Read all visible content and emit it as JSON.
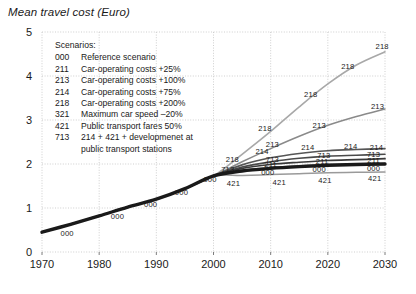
{
  "chart_data": {
    "type": "line",
    "title": "Mean travel cost (Euro)",
    "xlabel": "",
    "ylabel": "Mean travel cost (Euro)",
    "xlim": [
      1970,
      2030
    ],
    "ylim": [
      0,
      5
    ],
    "grid": true,
    "legend_position": "inside-top-left",
    "yticks": [
      "0",
      "1",
      "2",
      "3",
      "4",
      "5"
    ],
    "ytick_values": [
      0,
      1,
      2,
      3,
      4,
      5
    ],
    "xticks": [
      "1970",
      "1980",
      "1990",
      "2000",
      "2010",
      "2020",
      "2030"
    ],
    "xtick_values": [
      1970,
      1980,
      1990,
      2000,
      2010,
      2020,
      2030
    ],
    "x": [
      1970,
      1975,
      1980,
      1985,
      1990,
      1995,
      2000,
      2005,
      2010,
      2015,
      2020,
      2025,
      2030
    ],
    "series": [
      {
        "name": "000",
        "label": "Reference scenario",
        "color": "#1a1a1a",
        "width": 3.4,
        "values": [
          0.45,
          0.63,
          0.82,
          1.02,
          1.2,
          1.44,
          1.73,
          1.84,
          1.9,
          1.94,
          1.97,
          1.99,
          2.0
        ]
      },
      {
        "name": "211",
        "label": "Car-operating costs +25%",
        "color": "#3a3a3a",
        "width": 1.7,
        "values": [
          0.45,
          0.63,
          0.82,
          1.02,
          1.2,
          1.44,
          1.73,
          1.9,
          1.99,
          2.04,
          2.08,
          2.1,
          2.12
        ]
      },
      {
        "name": "213",
        "label": "Car-operating costs +100%",
        "color": "#8a8a8a",
        "width": 1.5,
        "values": [
          0.45,
          0.63,
          0.82,
          1.02,
          1.2,
          1.44,
          1.73,
          2.05,
          2.35,
          2.63,
          2.88,
          3.08,
          3.25
        ]
      },
      {
        "name": "214",
        "label": "Car-operating costs +75%",
        "color": "#565656",
        "width": 1.6,
        "values": [
          0.45,
          0.63,
          0.82,
          1.02,
          1.2,
          1.44,
          1.73,
          1.98,
          2.14,
          2.24,
          2.3,
          2.33,
          2.35
        ]
      },
      {
        "name": "218",
        "label": "Car-operating costs +200%",
        "color": "#a8a8a8",
        "width": 1.6,
        "values": [
          0.45,
          0.63,
          0.82,
          1.02,
          1.2,
          1.44,
          1.73,
          2.22,
          2.74,
          3.3,
          3.82,
          4.25,
          4.55
        ]
      },
      {
        "name": "321",
        "label": "Maximum car speed –20%",
        "color": "#6e6e6e",
        "width": 1.4,
        "values": [
          0.45,
          0.63,
          0.82,
          1.02,
          1.2,
          1.44,
          1.73,
          1.86,
          1.92,
          1.96,
          1.99,
          2.0,
          2.01
        ]
      },
      {
        "name": "421",
        "label": "Public transport fares 50%",
        "color": "#9a9a9a",
        "width": 1.5,
        "values": [
          0.45,
          0.63,
          0.82,
          1.02,
          1.2,
          1.44,
          1.73,
          1.74,
          1.76,
          1.78,
          1.8,
          1.81,
          1.82
        ]
      },
      {
        "name": "713",
        "label": "214 + 421 + developmenet at public transport stations",
        "color": "#4a4a4a",
        "width": 1.6,
        "values": [
          0.45,
          0.63,
          0.82,
          1.02,
          1.2,
          1.44,
          1.73,
          1.93,
          2.05,
          2.13,
          2.18,
          2.2,
          2.22
        ]
      }
    ],
    "curve_tags": [
      {
        "series": "000",
        "x": 1974.4,
        "y": 0.43
      },
      {
        "series": "000",
        "x": 1983.2,
        "y": 0.82
      },
      {
        "series": "000",
        "x": 1989.0,
        "y": 1.09
      },
      {
        "series": "000",
        "x": 1994.4,
        "y": 1.36
      },
      {
        "series": "000",
        "x": 1999.4,
        "y": 1.66
      },
      {
        "series": "000",
        "x": 2009.5,
        "y": 1.81
      },
      {
        "series": "000",
        "x": 2018.5,
        "y": 1.88
      },
      {
        "series": "000",
        "x": 2028.0,
        "y": 1.92
      },
      {
        "series": "421",
        "x": 2003.5,
        "y": 1.56
      },
      {
        "series": "421",
        "x": 2011.5,
        "y": 1.6
      },
      {
        "series": "421",
        "x": 2019.5,
        "y": 1.63
      },
      {
        "series": "421",
        "x": 2028.2,
        "y": 1.68
      },
      {
        "series": "211",
        "x": 2010.0,
        "y": 2.0
      },
      {
        "series": "211",
        "x": 2019.0,
        "y": 2.06
      },
      {
        "series": "211",
        "x": 2028.0,
        "y": 2.1
      },
      {
        "series": "713",
        "x": 2002.5,
        "y": 1.88
      },
      {
        "series": "713",
        "x": 2010.3,
        "y": 2.11
      },
      {
        "series": "713",
        "x": 2019.3,
        "y": 2.2
      },
      {
        "series": "713",
        "x": 2028.0,
        "y": 2.23
      },
      {
        "series": "214",
        "x": 2008.5,
        "y": 2.29
      },
      {
        "series": "214",
        "x": 2016.5,
        "y": 2.38
      },
      {
        "series": "214",
        "x": 2024.0,
        "y": 2.42
      },
      {
        "series": "214",
        "x": 2028.5,
        "y": 2.38
      },
      {
        "series": "213",
        "x": 2010.3,
        "y": 2.45
      },
      {
        "series": "213",
        "x": 2018.5,
        "y": 2.89
      },
      {
        "series": "213",
        "x": 2028.7,
        "y": 3.32
      },
      {
        "series": "218",
        "x": 2003.3,
        "y": 2.12
      },
      {
        "series": "218",
        "x": 2009.0,
        "y": 2.82
      },
      {
        "series": "218",
        "x": 2017.0,
        "y": 3.6
      },
      {
        "series": "218",
        "x": 2023.5,
        "y": 4.22
      },
      {
        "series": "218",
        "x": 2029.5,
        "y": 4.68
      }
    ]
  },
  "legend": {
    "heading": "Scenarios:",
    "items": [
      {
        "code": "000",
        "text": "Reference scenario"
      },
      {
        "code": "211",
        "text": "Car-operating costs +25%"
      },
      {
        "code": "213",
        "text": "Car-operating costs +100%"
      },
      {
        "code": "214",
        "text": "Car-operating costs +75%"
      },
      {
        "code": "218",
        "text": "Car-operating costs +200%"
      },
      {
        "code": "321",
        "text": "Maximum car speed –20%"
      },
      {
        "code": "421",
        "text": "Public transport fares 50%"
      },
      {
        "code": "713",
        "text": "214 + 421 + developmenet at"
      }
    ],
    "continuation": "public transport stations"
  },
  "colors": {
    "grid": "#c9c9c9",
    "text": "#1a1a1a",
    "background": "#ffffff"
  }
}
